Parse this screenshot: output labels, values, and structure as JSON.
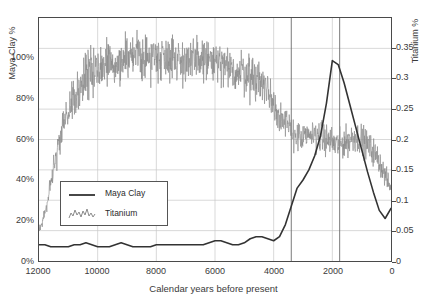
{
  "chart_data": {
    "type": "line",
    "title": "",
    "xlabel": "Calendar years before present",
    "ylabel": "Maya Clay %",
    "ylabel_right": "Titanium %",
    "xlim": [
      12000,
      0
    ],
    "x_reversed": true,
    "ylim": [
      0,
      120
    ],
    "ylim_right": [
      0,
      0.4
    ],
    "grid": true,
    "legend_position": "left-lower",
    "xticks": [
      "12000",
      "10000",
      "8000",
      "6000",
      "4000",
      "2000",
      "0"
    ],
    "xtick_values": [
      12000,
      10000,
      8000,
      6000,
      4000,
      2000,
      0
    ],
    "yticks_left": [
      "0%",
      "20%",
      "40%",
      "60%",
      "80%",
      "100%"
    ],
    "ytick_values_left": [
      0,
      20,
      40,
      60,
      80,
      100
    ],
    "yticks_right": [
      "0",
      "0.05",
      "0.1",
      "0.15",
      "0.2",
      "0.25",
      "0.3",
      "0.35"
    ],
    "ytick_values_right": [
      0,
      0.05,
      0.1,
      0.15,
      0.2,
      0.25,
      0.3,
      0.35
    ],
    "annotations": [
      {
        "text_line1": "Holocene",
        "text_line2": "Thermal Maximum",
        "x_center": 7300,
        "x_start": 12000,
        "x_end": 3400
      },
      {
        "text_line1": "Chaos",
        "text_line2": "Period",
        "x_center": 2700,
        "x_start": 3400,
        "x_end": 1750
      },
      {
        "text_line1": "Stable",
        "text_line2": "Period",
        "x_center": 1200,
        "x_start": 1750,
        "x_end": 0
      }
    ],
    "divider_x_values": [
      3400,
      1750
    ],
    "series": [
      {
        "name": "Maya Clay",
        "axis": "left",
        "color": "#333333",
        "style": "solid",
        "x": [
          12000,
          11800,
          11600,
          11400,
          11200,
          11000,
          10800,
          10600,
          10400,
          10200,
          10000,
          9800,
          9600,
          9400,
          9200,
          9000,
          8800,
          8600,
          8400,
          8200,
          8000,
          7800,
          7600,
          7400,
          7200,
          7000,
          6800,
          6600,
          6400,
          6200,
          6000,
          5800,
          5600,
          5400,
          5200,
          5000,
          4800,
          4600,
          4400,
          4200,
          4000,
          3800,
          3600,
          3400,
          3200,
          3000,
          2800,
          2600,
          2400,
          2200,
          2000,
          1800,
          1600,
          1400,
          1200,
          1000,
          800,
          600,
          400,
          200,
          0
        ],
        "y": [
          8,
          8,
          7,
          7,
          7,
          7,
          8,
          8,
          9,
          8,
          7,
          7,
          7,
          8,
          9,
          8,
          7,
          7,
          7,
          7,
          8,
          8,
          8,
          8,
          8,
          8,
          8,
          8,
          8,
          9,
          10,
          10,
          9,
          8,
          8,
          9,
          11,
          12,
          12,
          11,
          10,
          12,
          18,
          27,
          36,
          40,
          45,
          52,
          62,
          78,
          99,
          97,
          88,
          77,
          66,
          55,
          44,
          34,
          25,
          21,
          26
        ],
        "y_unit": "%"
      },
      {
        "name": "Titanium",
        "axis": "right",
        "color": "#8a8a8a",
        "style": "noisy-line",
        "description": "High-frequency noisy series; rises from ~0.05 at 12000 BP to ~0.33 plateau during Holocene Thermal Maximum, declines to ~0.20 after 3500 BP, noisy ~0.17-0.22 through Chaos and Stable periods, ending ~0.12",
        "x": [
          12000,
          11900,
          11800,
          11700,
          11600,
          11500,
          11400,
          11300,
          11200,
          11100,
          11000,
          10800,
          10600,
          10400,
          10200,
          10000,
          9800,
          9600,
          9400,
          9200,
          9000,
          8800,
          8600,
          8400,
          8200,
          8000,
          7800,
          7600,
          7400,
          7200,
          7000,
          6800,
          6600,
          6400,
          6200,
          6000,
          5800,
          5600,
          5400,
          5200,
          5000,
          4800,
          4600,
          4400,
          4200,
          4000,
          3800,
          3600,
          3400,
          3200,
          3000,
          2800,
          2600,
          2400,
          2200,
          2000,
          1800,
          1600,
          1400,
          1200,
          1000,
          800,
          600,
          400,
          200,
          0
        ],
        "y": [
          0.055,
          0.06,
          0.08,
          0.1,
          0.13,
          0.16,
          0.17,
          0.2,
          0.22,
          0.23,
          0.25,
          0.27,
          0.29,
          0.3,
          0.31,
          0.315,
          0.32,
          0.325,
          0.33,
          0.33,
          0.335,
          0.335,
          0.34,
          0.335,
          0.335,
          0.34,
          0.335,
          0.34,
          0.335,
          0.33,
          0.33,
          0.325,
          0.33,
          0.335,
          0.33,
          0.325,
          0.32,
          0.315,
          0.315,
          0.31,
          0.31,
          0.305,
          0.3,
          0.295,
          0.28,
          0.26,
          0.24,
          0.225,
          0.215,
          0.205,
          0.2,
          0.205,
          0.21,
          0.205,
          0.2,
          0.195,
          0.19,
          0.195,
          0.2,
          0.205,
          0.2,
          0.19,
          0.18,
          0.165,
          0.14,
          0.12
        ],
        "noise_amplitude": 0.022
      }
    ],
    "legend": [
      {
        "label": "Maya Clay",
        "marker": "solid-line",
        "color": "#333333"
      },
      {
        "label": "Titanium",
        "marker": "noisy-line",
        "color": "#8a8a8a"
      }
    ]
  }
}
